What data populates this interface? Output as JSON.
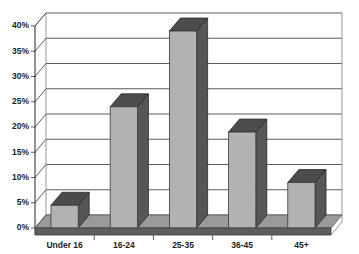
{
  "chart_data": {
    "type": "bar",
    "title": "",
    "subtitle": "",
    "xlabel": "",
    "ylabel": "",
    "categories": [
      "Under 16",
      "16-24",
      "25-35",
      "36-45",
      "45+"
    ],
    "values": [
      4.5,
      24,
      39,
      19,
      9
    ],
    "value_suffix": "%",
    "ylim": [
      0,
      40
    ],
    "ytick_labels": [
      "0%",
      "5%",
      "10%",
      "15%",
      "20%",
      "25%",
      "30%",
      "35%",
      "40%"
    ],
    "ytick_values": [
      0,
      5,
      10,
      15,
      20,
      25,
      30,
      35,
      40
    ],
    "grid": true,
    "legend": false,
    "legend_position": "none",
    "style": "3d-column",
    "series": [
      {
        "name": "",
        "values": [
          4.5,
          24,
          39,
          19,
          9
        ]
      }
    ],
    "colors": {
      "bar_front": "#b2b2b2",
      "bar_side": "#565656",
      "bar_top": "#4c4c4c",
      "plot_background": "#ffffff",
      "gridline": "#4a4a4a",
      "floor_top": "#9a9a9a",
      "floor_front": "#5e5e5e",
      "text": "#1d1d1d"
    }
  }
}
